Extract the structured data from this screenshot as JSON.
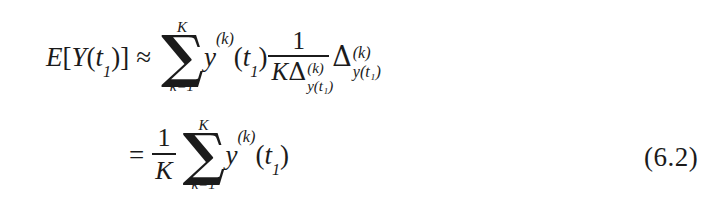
{
  "document": {
    "type": "scanned-textbook-equation",
    "background_color": "#ffffff",
    "text_color": "#1b1b1b"
  },
  "equation": {
    "number": "(6.2)",
    "line1": {
      "lhs": {
        "E": "E",
        "bracket_open": "[",
        "Y": "Y",
        "paren_open": "(",
        "t": "t",
        "t_sub": "1",
        "paren_close": ")",
        "bracket_close": "]"
      },
      "relation": "≈",
      "sum": {
        "upper_limit": "K",
        "symbol": "∑",
        "lower_limit": "k=1"
      },
      "summand": {
        "y": "y",
        "y_sup": "(k)",
        "paren_open": "(",
        "t": "t",
        "t_sub": "1",
        "paren_close": ")"
      },
      "fraction": {
        "numerator": "1",
        "denominator": {
          "K": "K",
          "delta": "Δ",
          "delta_sup": "(k)",
          "delta_sub": "y(t₁)"
        }
      },
      "trailing_delta": {
        "delta": "Δ",
        "delta_sup": "(k)",
        "delta_sub": "y(t₁)"
      }
    },
    "line2": {
      "relation": "=",
      "fraction": {
        "numerator": "1",
        "denominator": "K"
      },
      "sum": {
        "upper_limit": "K",
        "symbol": "∑",
        "lower_limit": "k=1"
      },
      "summand": {
        "y": "y",
        "y_sup": "(k)",
        "paren_open": "(",
        "t": "t",
        "t_sub": "1",
        "paren_close": ")"
      }
    },
    "plain_text": "E[Y(t1)] ≈ sum_{k=1}^{K} y^{(k)}(t1) * 1/(K Δ^{(k)}_{y(t1)}) * Δ^{(k)}_{y(t1)} = (1/K) sum_{k=1}^{K} y^{(k)}(t1)    (6.2)"
  }
}
